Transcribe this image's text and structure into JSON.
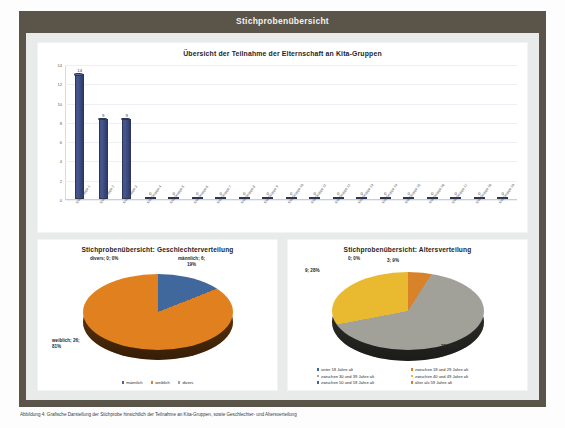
{
  "frame": {
    "title": "Stichprobenübersicht"
  },
  "caption": {
    "text": "Abbildung 4: Grafische Darstellung der Stichprobe hinsichtlich der Teilnahme an Kita-Gruppen, sowie Geschlechter- und Altersverteilung"
  },
  "bar_panel": {
    "title": "Übersicht der Teilnahme der Elternschaft an Kita-Gruppen"
  },
  "pie_left": {
    "title": "Stichprobenübersicht: Geschlechterverteilung",
    "labels": {
      "divers": "divers; 0; 0%",
      "maennlich": "männlich; 6;\n19%",
      "maennlich_l1": "männlich; 6;",
      "maennlich_l2": "19%",
      "weiblich_l1": "weiblich; 26;",
      "weiblich_l2": "81%"
    },
    "legend": [
      "männlich",
      "weiblich",
      "divers"
    ]
  },
  "pie_right": {
    "title": "Stichprobenübersicht: Altersverteilung",
    "labels": {
      "unter18": "0; 0%",
      "a18_29": "3; 9%",
      "a30_39": "9; 28%",
      "a40_49": "20; 63%"
    },
    "legend": [
      "unter 18 Jahre alt",
      "zwischen 18 und 29 Jahre alt",
      "zwischen 30 und 39 Jahre alt",
      "zwischen 40 und 49 Jahre alt",
      "zwischen 50 und 59 Jahre alt",
      "älter als 59 Jahre alt"
    ]
  },
  "colors": {
    "frame": "#5b5448",
    "stage": "#e9ebeb",
    "bar": "#46548c",
    "pie_blue": "#41689c",
    "pie_orange": "#e0801f",
    "pie_gray": "#a1a19a",
    "pie_yellow": "#e9b92f",
    "pie_orange2": "#d8822a"
  },
  "chart_data": [
    {
      "type": "bar",
      "title": "Übersicht der Teilnahme der Elternschaft an Kita-Gruppen",
      "xlabel": "",
      "ylabel": "",
      "ylim": [
        0,
        14
      ],
      "yticks": [
        0,
        2,
        4,
        6,
        8,
        10,
        12,
        14
      ],
      "grid": true,
      "legend": "none",
      "categories": [
        "Kita-Gruppe 1",
        "Kita-Gruppe 2",
        "Kita-Gruppe 3",
        "Kita-Gruppe 4",
        "Kita-Gruppe 5",
        "Kita-Gruppe 6",
        "Kita-Gruppe 7",
        "Kita-Gruppe 8",
        "Kita-Gruppe 9",
        "Kita-Gruppe 10",
        "Kita-Gruppe 11",
        "Kita-Gruppe 12",
        "Kita-Gruppe 13",
        "Kita-Gruppe 14",
        "Kita-Gruppe 15",
        "Kita-Gruppe 16",
        "Kita-Gruppe 17",
        "Kita-Gruppe 18",
        "Kita-Gruppe 19"
      ],
      "values": [
        14,
        9,
        9,
        0,
        0,
        0,
        0,
        0,
        0,
        0,
        0,
        0,
        0,
        0,
        0,
        0,
        0,
        0,
        0
      ],
      "data_labels": [
        "14",
        "9",
        "9",
        "0",
        "0",
        "0",
        "0",
        "0",
        "0",
        "0",
        "0",
        "0",
        "0",
        "0",
        "0",
        "0",
        "0",
        "0",
        "0"
      ]
    },
    {
      "type": "pie",
      "title": "Stichprobenübersicht: Geschlechterverteilung",
      "legend_position": "bottom",
      "labels": [
        "männlich",
        "weiblich",
        "divers"
      ],
      "values": [
        6,
        26,
        0
      ],
      "percents": [
        "19%",
        "81%",
        "0%"
      ],
      "colors": [
        "#41689c",
        "#e0801f",
        "#a1a19a"
      ]
    },
    {
      "type": "pie",
      "title": "Stichprobenübersicht: Altersverteilung",
      "legend_position": "bottom",
      "labels": [
        "unter 18 Jahre alt",
        "zwischen 18 und 29 Jahre alt",
        "zwischen 30 und 39 Jahre alt",
        "zwischen 40 und 49 Jahre alt",
        "zwischen 50 und 59 Jahre alt",
        "älter als 59 Jahre alt"
      ],
      "values": [
        0,
        3,
        20,
        9,
        0,
        0
      ],
      "percents": [
        "0%",
        "9%",
        "63%",
        "28%",
        "0%",
        "0%"
      ],
      "colors": [
        "#41689c",
        "#d8822a",
        "#a1a19a",
        "#e9b92f",
        "#41689c",
        "#d8822a"
      ]
    }
  ]
}
